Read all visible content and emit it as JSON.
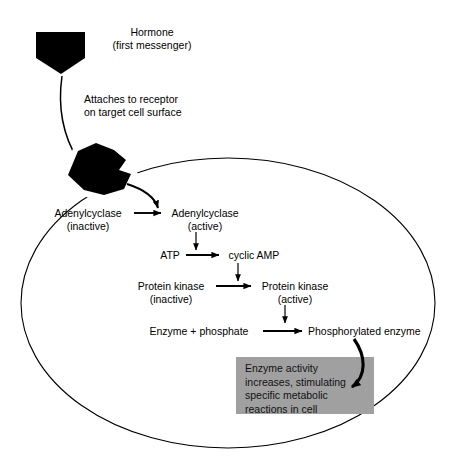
{
  "diagram": {
    "title_text": "Hormone",
    "subtitle_text": "(first messenger)",
    "attach_line1": "Attaches to receptor",
    "attach_line2": "on target cell surface",
    "cell_outline_color": "#000000",
    "hormone_fill_color": "#000000",
    "gray_box_color": "#a0a0a0",
    "labels": {
      "adenylcyclase_inactive_l1": "Adenylcyclase",
      "adenylcyclase_inactive_l2": "(inactive)",
      "adenylcyclase_active_l1": "Adenylcyclase",
      "adenylcyclase_active_l2": "(active)",
      "atp": "ATP",
      "cyclic_amp": "cyclic AMP",
      "protein_kinase_inactive_l1": "Protein kinase",
      "protein_kinase_inactive_l2": "(inactive)",
      "protein_kinase_active_l1": "Protein kinase",
      "protein_kinase_active_l2": "(active)",
      "enzyme_phosphate": "Enzyme + phosphate",
      "phosphorylated_enzyme": "Phosphorylated enzyme"
    },
    "outcome_box": {
      "line1": "Enzyme activity",
      "line2": "increases, stimulating",
      "line3": "specific metabolic",
      "line4": "reactions in cell"
    }
  }
}
